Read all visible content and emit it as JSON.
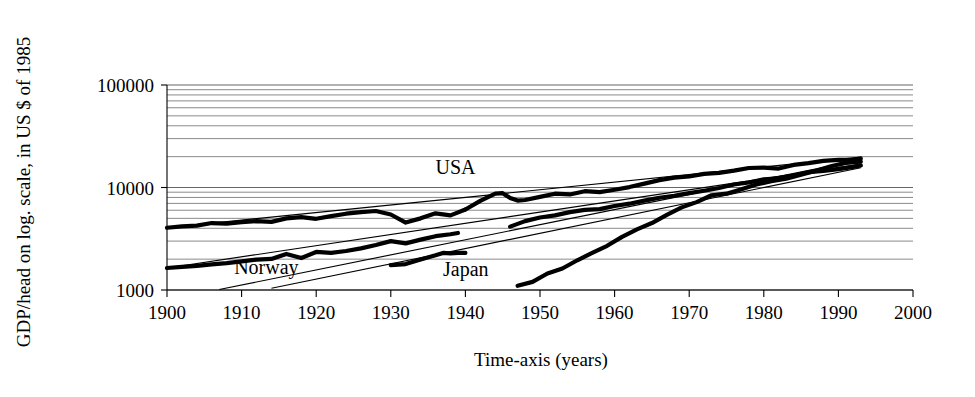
{
  "chart_data": {
    "type": "line",
    "title": "",
    "xlabel": "Time-axis (years)",
    "ylabel": "GDP/head on log. scale, in US $ of 1985",
    "yscale": "log",
    "xlim": [
      1900,
      2000
    ],
    "ylim": [
      1000,
      100000
    ],
    "grid": "horizontal log minor gridlines",
    "legend_position": "inline labels on plot",
    "xticks": [
      "1900",
      "1910",
      "1920",
      "1930",
      "1940",
      "1950",
      "1960",
      "1970",
      "1980",
      "1990",
      "2000"
    ],
    "yticks": [
      "1000",
      "10000",
      "100000"
    ],
    "series": [
      {
        "name": "USA",
        "label": "USA",
        "label_x": 1936,
        "label_y": 13500,
        "segments": [
          {
            "x": [
              1900,
              1902,
              1904,
              1906,
              1908,
              1910,
              1912,
              1914,
              1916,
              1918,
              1920,
              1922,
              1924,
              1926,
              1928,
              1930,
              1932,
              1934,
              1936,
              1938,
              1940
            ],
            "y": [
              4050,
              4180,
              4250,
              4500,
              4450,
              4600,
              4700,
              4620,
              5000,
              5150,
              4950,
              5250,
              5550,
              5750,
              5900,
              5450,
              4550,
              5000,
              5600,
              5350,
              6100
            ]
          },
          {
            "x": [
              1940,
              1942,
              1944,
              1945,
              1946,
              1947,
              1948,
              1950,
              1952,
              1954,
              1956,
              1958,
              1960,
              1962,
              1964,
              1966,
              1968,
              1970,
              1972,
              1974,
              1976,
              1978,
              1980,
              1982,
              1984,
              1986,
              1988,
              1990,
              1992,
              1993
            ],
            "y": [
              6100,
              7400,
              8700,
              8800,
              7900,
              7450,
              7550,
              8100,
              8700,
              8550,
              9200,
              9000,
              9500,
              10100,
              10900,
              11800,
              12500,
              12800,
              13600,
              13900,
              14600,
              15500,
              15600,
              15300,
              16600,
              17300,
              18200,
              18600,
              18700,
              19200
            ]
          }
        ]
      },
      {
        "name": "Norway",
        "label": "Norway",
        "label_x": 1909,
        "label_y": 1430,
        "segments": [
          {
            "x": [
              1900,
              1902,
              1904,
              1906,
              1908,
              1910,
              1912,
              1914,
              1916,
              1918,
              1920,
              1922,
              1924,
              1926,
              1928,
              1930,
              1932,
              1934,
              1936,
              1938,
              1939
            ],
            "y": [
              1640,
              1680,
              1720,
              1780,
              1830,
              1900,
              1980,
              2010,
              2250,
              2050,
              2350,
              2300,
              2400,
              2550,
              2750,
              3000,
              2850,
              3100,
              3350,
              3500,
              3600
            ]
          },
          {
            "x": [
              1946,
              1948,
              1950,
              1952,
              1954,
              1956,
              1958,
              1960,
              1962,
              1964,
              1966,
              1968,
              1970,
              1972,
              1974,
              1976,
              1978,
              1980,
              1982,
              1984,
              1986,
              1988,
              1990,
              1992,
              1993
            ],
            "y": [
              4150,
              4700,
              5100,
              5350,
              5750,
              6050,
              6150,
              6600,
              6950,
              7450,
              7950,
              8300,
              8800,
              9300,
              9900,
              10700,
              11200,
              12000,
              12300,
              13100,
              14100,
              14500,
              15100,
              15900,
              16400
            ]
          }
        ]
      },
      {
        "name": "Japan",
        "label": "Japan",
        "label_x": 1937,
        "label_y": 1380,
        "segments": [
          {
            "x": [
              1930,
              1932,
              1934,
              1936,
              1937,
              1938,
              1939,
              1940
            ],
            "y": [
              1750,
              1790,
              1980,
              2180,
              2300,
              2280,
              2300,
              2300
            ]
          },
          {
            "x": [
              1947,
              1949,
              1951,
              1953,
              1955,
              1957,
              1959,
              1961,
              1963,
              1965,
              1967,
              1969,
              1971,
              1973,
              1975,
              1977,
              1979,
              1981,
              1983,
              1985,
              1987,
              1989,
              1991,
              1993
            ],
            "y": [
              1100,
              1200,
              1450,
              1620,
              1950,
              2300,
              2700,
              3300,
              3900,
              4500,
              5400,
              6400,
              7200,
              8400,
              8700,
              9600,
              10700,
              11500,
              12200,
              13300,
              14600,
              16100,
              17400,
              17900
            ]
          }
        ]
      }
    ],
    "trend_lines": [
      {
        "name": "usa-trend",
        "x1": 1900,
        "y1": 4050,
        "x2": 1993,
        "y2": 19800
      },
      {
        "name": "norway-trend",
        "x1": 1900,
        "y1": 1640,
        "x2": 1993,
        "y2": 16900
      },
      {
        "name": "japan-trend-long",
        "x1": 1907,
        "y1": 1010,
        "x2": 1993,
        "y2": 18600
      },
      {
        "name": "japan-trend-short",
        "x1": 1914,
        "y1": 1040,
        "x2": 1993,
        "y2": 15600
      }
    ]
  }
}
